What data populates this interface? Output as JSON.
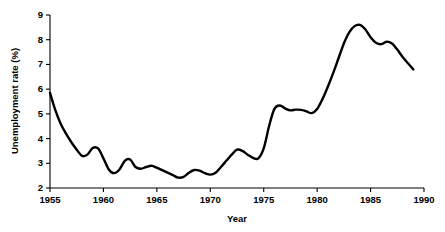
{
  "chart_data": {
    "type": "line",
    "title": "",
    "subtitle": "",
    "xlabel": "Year",
    "ylabel": "Unemployment rate (%)",
    "xlim": [
      1955,
      1990
    ],
    "ylim": [
      2,
      9
    ],
    "grid": false,
    "legend": false,
    "legend_position": "none",
    "line_color": "#000000",
    "background_color": "#ffffff",
    "xticks": [
      1955,
      1960,
      1965,
      1970,
      1975,
      1980,
      1985,
      1990
    ],
    "xtick_labels": [
      "1955",
      "1960",
      "1965",
      "1970",
      "1975",
      "1980",
      "1985",
      "1990"
    ],
    "yticks": [
      2,
      3,
      4,
      5,
      6,
      7,
      8,
      9
    ],
    "ytick_labels": [
      "2",
      "3",
      "4",
      "5",
      "6",
      "7",
      "8",
      "9"
    ],
    "series": [
      {
        "name": "Unemployment rate",
        "x": [
          1955.0,
          1955.5,
          1956.0,
          1956.5,
          1957.0,
          1957.5,
          1958.0,
          1958.5,
          1959.0,
          1959.5,
          1960.0,
          1960.5,
          1961.0,
          1961.5,
          1962.0,
          1962.5,
          1963.0,
          1963.5,
          1964.0,
          1964.5,
          1965.0,
          1965.5,
          1966.0,
          1966.5,
          1967.0,
          1967.5,
          1968.0,
          1968.5,
          1969.0,
          1969.5,
          1970.0,
          1970.5,
          1971.0,
          1971.5,
          1972.0,
          1972.5,
          1973.0,
          1973.5,
          1974.0,
          1974.5,
          1975.0,
          1975.5,
          1976.0,
          1976.5,
          1977.0,
          1977.5,
          1978.0,
          1978.5,
          1979.0,
          1979.5,
          1980.0,
          1980.5,
          1981.0,
          1981.5,
          1982.0,
          1982.5,
          1983.0,
          1983.5,
          1984.0,
          1984.5,
          1985.0,
          1985.5,
          1986.0,
          1986.5,
          1987.0,
          1987.5,
          1988.0,
          1988.5,
          1989.0
        ],
        "y": [
          5.85,
          5.15,
          4.6,
          4.2,
          3.85,
          3.55,
          3.3,
          3.35,
          3.62,
          3.6,
          3.2,
          2.75,
          2.6,
          2.75,
          3.1,
          3.15,
          2.85,
          2.78,
          2.85,
          2.9,
          2.82,
          2.72,
          2.62,
          2.52,
          2.42,
          2.45,
          2.62,
          2.73,
          2.7,
          2.6,
          2.54,
          2.62,
          2.85,
          3.1,
          3.35,
          3.55,
          3.5,
          3.35,
          3.22,
          3.2,
          3.6,
          4.5,
          5.2,
          5.34,
          5.22,
          5.14,
          5.17,
          5.16,
          5.1,
          5.03,
          5.2,
          5.6,
          6.1,
          6.65,
          7.25,
          7.85,
          8.3,
          8.55,
          8.6,
          8.42,
          8.1,
          7.88,
          7.82,
          7.92,
          7.85,
          7.6,
          7.3,
          7.05,
          6.8
        ]
      }
    ]
  }
}
